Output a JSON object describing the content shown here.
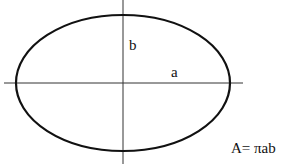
{
  "diagram": {
    "labels": {
      "semi_minor": "b",
      "semi_major": "a",
      "formula": "A= πab"
    },
    "colors": {
      "background": "#ffffff",
      "stroke": "#111111",
      "axis": "#333333"
    },
    "geometry": {
      "ellipse": {
        "cx": 123,
        "cy": 83,
        "rx": 107,
        "ry": 68
      },
      "x_axis": {
        "x1": 4,
        "x2": 243,
        "y": 83
      },
      "y_axis": {
        "x": 123,
        "y1": 0,
        "y2": 164
      }
    }
  }
}
